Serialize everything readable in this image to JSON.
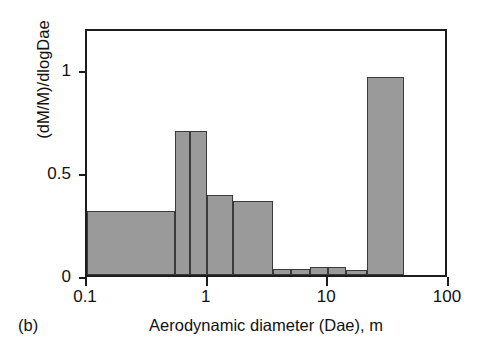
{
  "panel": {
    "label": "(b)"
  },
  "chart_data": {
    "type": "bar",
    "title": "",
    "subtitle": "",
    "xlabel": "Aerodynamic diameter (Dae), m",
    "ylabel": "(dM/M)/dlogDae",
    "xscale": "log",
    "xlim": [
      0.1,
      100
    ],
    "ylim": [
      0,
      1.2
    ],
    "xticks": [
      0.1,
      1,
      10,
      100
    ],
    "xtick_labels": [
      "0.1",
      "1",
      "10",
      "100"
    ],
    "yticks": [
      0,
      0.5,
      1
    ],
    "ytick_labels": [
      "0",
      "0.5",
      "1"
    ],
    "grid": false,
    "legend": null,
    "bar_color": "#9a9a9a",
    "bar_edge_color": "#3a3a3a",
    "frame_color": "#1c1c1c",
    "background": "#ffffff",
    "bin_edges": [
      0.1,
      0.54,
      0.72,
      0.98,
      1.61,
      3.5,
      4.9,
      7.0,
      10.0,
      14.0,
      21.0,
      42.0
    ],
    "bars": [
      {
        "x_low": 0.1,
        "x_high": 0.54,
        "value": 0.31
      },
      {
        "x_low": 0.54,
        "x_high": 0.72,
        "value": 0.7
      },
      {
        "x_low": 0.72,
        "x_high": 0.98,
        "value": 0.7
      },
      {
        "x_low": 0.98,
        "x_high": 1.61,
        "value": 0.39
      },
      {
        "x_low": 1.61,
        "x_high": 3.5,
        "value": 0.36
      },
      {
        "x_low": 3.5,
        "x_high": 4.9,
        "value": 0.03
      },
      {
        "x_low": 4.9,
        "x_high": 7.0,
        "value": 0.03
      },
      {
        "x_low": 7.0,
        "x_high": 10.0,
        "value": 0.04
      },
      {
        "x_low": 10.0,
        "x_high": 14.0,
        "value": 0.04
      },
      {
        "x_low": 14.0,
        "x_high": 21.0,
        "value": 0.025
      },
      {
        "x_low": 21.0,
        "x_high": 42.0,
        "value": 0.96
      }
    ]
  }
}
